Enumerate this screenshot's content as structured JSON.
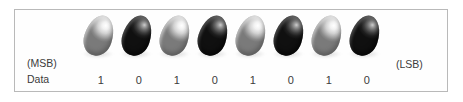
{
  "figure": {
    "type": "binary-data-bit-diagram",
    "frame": {
      "border_color": "#b9b9b9",
      "background": "#fefefe"
    },
    "labels": {
      "msb": "(MSB)",
      "lsb": "(LSB)",
      "data_row": "Data"
    },
    "bits": [
      {
        "index": 0,
        "value": "1",
        "marker": "light-egg-icon",
        "marker_state": "light"
      },
      {
        "index": 1,
        "value": "0",
        "marker": "dark-egg-icon",
        "marker_state": "dark"
      },
      {
        "index": 2,
        "value": "1",
        "marker": "light-egg-icon",
        "marker_state": "light"
      },
      {
        "index": 3,
        "value": "0",
        "marker": "dark-egg-icon",
        "marker_state": "dark"
      },
      {
        "index": 4,
        "value": "1",
        "marker": "light-egg-icon",
        "marker_state": "light"
      },
      {
        "index": 5,
        "value": "0",
        "marker": "dark-egg-icon",
        "marker_state": "dark"
      },
      {
        "index": 6,
        "value": "1",
        "marker": "light-egg-icon",
        "marker_state": "light"
      },
      {
        "index": 7,
        "value": "0",
        "marker": "dark-egg-icon",
        "marker_state": "dark"
      }
    ],
    "colors": {
      "text": "#3b3b3b",
      "light_marker": "#e6e6e6",
      "dark_marker": "#1f1f1f",
      "page_background": "#ffffff"
    }
  }
}
